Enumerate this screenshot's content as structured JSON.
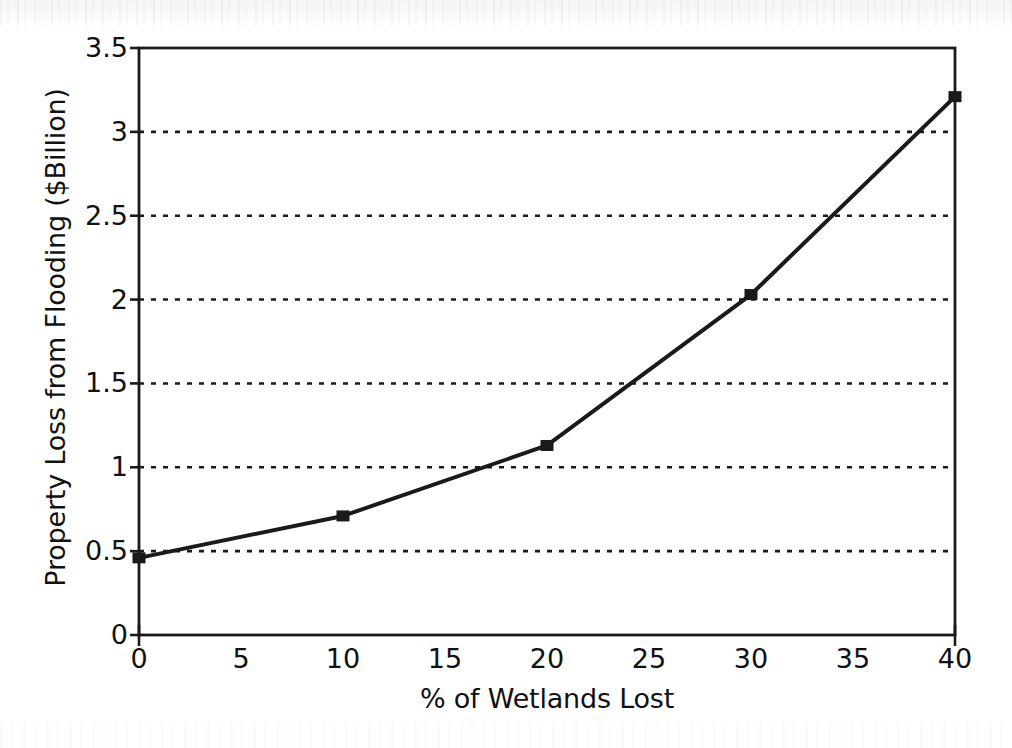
{
  "chart_data": {
    "type": "line",
    "title": "",
    "subtitle": "",
    "xlabel": "% of Wetlands Lost",
    "ylabel": "Property Loss from Flooding ($Billion)",
    "x": [
      0,
      10,
      20,
      30,
      40
    ],
    "values": [
      0.46,
      0.71,
      1.13,
      2.03,
      3.21
    ],
    "series": [
      {
        "name": "Property Loss from Flooding",
        "values": [
          0.46,
          0.71,
          1.13,
          2.03,
          3.21
        ]
      }
    ],
    "xlim": [
      0,
      40
    ],
    "ylim": [
      0,
      3.5
    ],
    "x_ticks": [
      0,
      5,
      10,
      15,
      20,
      25,
      30,
      35,
      40
    ],
    "x_tick_labels": [
      "0",
      "5",
      "10",
      "15",
      "20",
      "25",
      "30",
      "35",
      "40"
    ],
    "y_ticks": [
      0,
      0.5,
      1,
      1.5,
      2,
      2.5,
      3,
      3.5
    ],
    "y_tick_labels": [
      "0",
      "0.5",
      "1",
      "1.5",
      "2",
      "2.5",
      "3",
      "3.5"
    ],
    "grid": {
      "horizontal": true,
      "vertical": false,
      "style": "dotted",
      "color": "#1a1a1a"
    },
    "legend": {
      "visible": false,
      "position": "none",
      "entries": []
    },
    "marker": {
      "shape": "square",
      "color": "#1a1a1a",
      "size": 13
    },
    "line": {
      "color": "#1a1a1a",
      "width": 4,
      "style": "solid"
    },
    "plot_border": {
      "visible": true,
      "color": "#1a1a1a"
    },
    "annotations": []
  },
  "colors": {
    "ink": "#1a1a1a",
    "background": "#ffffff",
    "grid": "#1a1a1a"
  }
}
